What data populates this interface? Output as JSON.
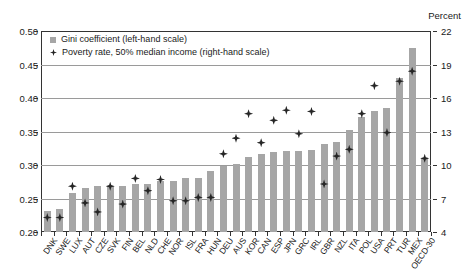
{
  "chart_data": {
    "type": "bar",
    "title": "",
    "subtitle": "",
    "unit_label": "Percent",
    "xlabel": "",
    "ylabel": "",
    "grid": true,
    "legend_position": "top-left",
    "categories": [
      "DNK",
      "SWE",
      "LUX",
      "AUT",
      "CZE",
      "SVK",
      "FIN",
      "BEL",
      "NLD",
      "CHE",
      "NOR",
      "ISL",
      "FRA",
      "HUN",
      "DEU",
      "AUS",
      "KOR",
      "CAN",
      "ESP",
      "JPN",
      "GRC",
      "IRL",
      "GBR",
      "NZL",
      "ITA",
      "POL",
      "USA",
      "PRT",
      "TUR",
      "MEX",
      "OECD-30"
    ],
    "left_axis": {
      "name": "Gini coefficient (left-hand scale)",
      "ylim": [
        0.2,
        0.5
      ],
      "ticks": [
        "0.20",
        "0.25",
        "0.30",
        "0.35",
        "0.40",
        "0.45",
        "0.50"
      ]
    },
    "right_axis": {
      "name": "Poverty rate, 50% median income (right-hand scale)",
      "ylim": [
        4,
        22
      ],
      "ticks": [
        "4",
        "7",
        "10",
        "13",
        "16",
        "19",
        "22"
      ]
    },
    "series": [
      {
        "name": "Gini coefficient (left-hand scale)",
        "axis": "left",
        "type": "bar",
        "color": "#a6a6a6",
        "values": [
          0.232,
          0.234,
          0.258,
          0.265,
          0.268,
          0.268,
          0.269,
          0.271,
          0.271,
          0.276,
          0.276,
          0.28,
          0.281,
          0.291,
          0.298,
          0.301,
          0.312,
          0.317,
          0.319,
          0.321,
          0.321,
          0.323,
          0.331,
          0.335,
          0.352,
          0.372,
          0.381,
          0.385,
          0.43,
          0.474,
          0.311
        ]
      },
      {
        "name": "Poverty rate, 50% median income (right-hand scale)",
        "axis": "right",
        "type": "scatter",
        "color": "#262626",
        "values": [
          5.3,
          5.3,
          8.1,
          6.6,
          5.8,
          8.1,
          6.5,
          8.8,
          7.7,
          8.7,
          6.8,
          6.8,
          7.1,
          7.1,
          11.0,
          12.4,
          14.6,
          12.0,
          14.0,
          14.9,
          12.8,
          14.8,
          8.3,
          10.8,
          11.4,
          14.6,
          17.1,
          12.9,
          17.5,
          18.4,
          10.6
        ]
      }
    ]
  }
}
